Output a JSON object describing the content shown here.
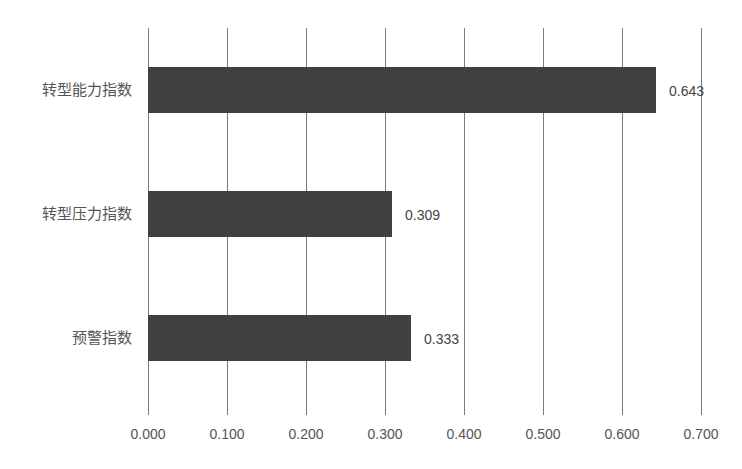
{
  "chart_data": {
    "type": "bar",
    "orientation": "horizontal",
    "title": "",
    "xlabel": "",
    "ylabel": "",
    "categories": [
      "转型能力指数",
      "转型压力指数",
      "预警指数"
    ],
    "values": [
      0.643,
      0.309,
      0.333
    ],
    "value_labels": [
      "0.643",
      "0.309",
      "0.333"
    ],
    "xlim": [
      0,
      0.7
    ],
    "x_ticks": [
      0.0,
      0.1,
      0.2,
      0.3,
      0.4,
      0.5,
      0.6,
      0.7
    ],
    "x_tick_labels": [
      "0.000",
      "0.100",
      "0.200",
      "0.300",
      "0.400",
      "0.500",
      "0.600",
      "0.700"
    ],
    "grid": "vertical",
    "legend": "none",
    "bar_color": "#3f3f3f"
  }
}
